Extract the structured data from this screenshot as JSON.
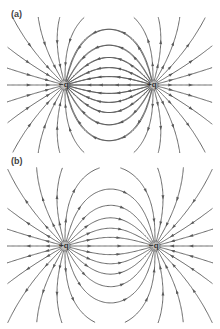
{
  "panels": [
    {
      "label": "(a)",
      "charges": [
        {
          "name": "left",
          "label": "−q",
          "x": 65,
          "y": 85
        },
        {
          "name": "right",
          "label": "+q",
          "x": 153,
          "y": 85
        }
      ]
    },
    {
      "label": "(b)",
      "charges": [
        {
          "name": "left",
          "label": "+q",
          "x": 65,
          "y": 246
        },
        {
          "name": "right",
          "label": "−q",
          "x": 155,
          "y": 246
        }
      ]
    }
  ],
  "colors": {
    "line": "#5a5a5a",
    "charge": "#8a8a8a",
    "background": "#ffffff"
  }
}
